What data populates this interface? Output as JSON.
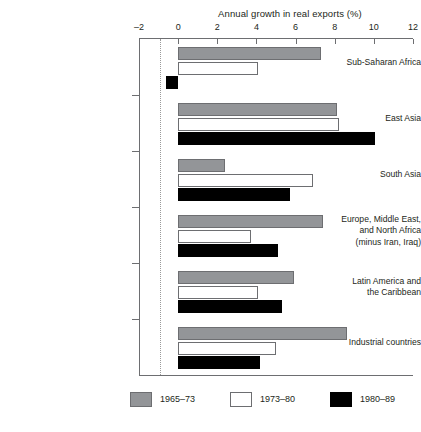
{
  "chart_data": {
    "type": "bar",
    "orientation": "horizontal",
    "title": "Annual growth in real exports (%)",
    "xlabel": "Annual growth in real exports (%)",
    "ylabel": "",
    "xlim": [
      -2,
      12
    ],
    "xticks": [
      -2,
      0,
      2,
      4,
      6,
      8,
      10,
      12
    ],
    "xtick_labels": [
      "–2",
      "0",
      "2",
      "4",
      "6",
      "8",
      "10",
      "12"
    ],
    "grid": false,
    "legend_position": "bottom",
    "categories": [
      "Sub-Saharan Africa",
      "East Asia",
      "South Asia",
      "Europe, Middle East, and North Africa (minus Iran, Iraq)",
      "Latin America and the Caribbean",
      "Industrial countries"
    ],
    "category_lines": [
      [
        "Sub-Saharan Africa"
      ],
      [
        "East Asia"
      ],
      [
        "South Asia"
      ],
      [
        "Europe, Middle East,",
        "and North Africa",
        "(minus Iran, Iraq)"
      ],
      [
        "Latin America and",
        "the Caribbean"
      ],
      [
        "Industrial countries"
      ]
    ],
    "series": [
      {
        "name": "1965–73",
        "color": "#939598",
        "values": [
          7.3,
          8.1,
          2.4,
          7.4,
          5.9,
          8.65
        ]
      },
      {
        "name": "1973–80",
        "color": "#ffffff",
        "values": [
          4.1,
          8.2,
          6.9,
          3.7,
          4.1,
          5.0
        ]
      },
      {
        "name": "1980–89",
        "color": "#000000",
        "values": [
          -0.6,
          10.05,
          5.7,
          5.1,
          5.3,
          4.2
        ]
      }
    ]
  },
  "legend": {
    "items": [
      {
        "label": "1965–73",
        "swatch": "gray"
      },
      {
        "label": "1973–80",
        "swatch": "white"
      },
      {
        "label": "1980–89",
        "swatch": "black"
      }
    ]
  }
}
